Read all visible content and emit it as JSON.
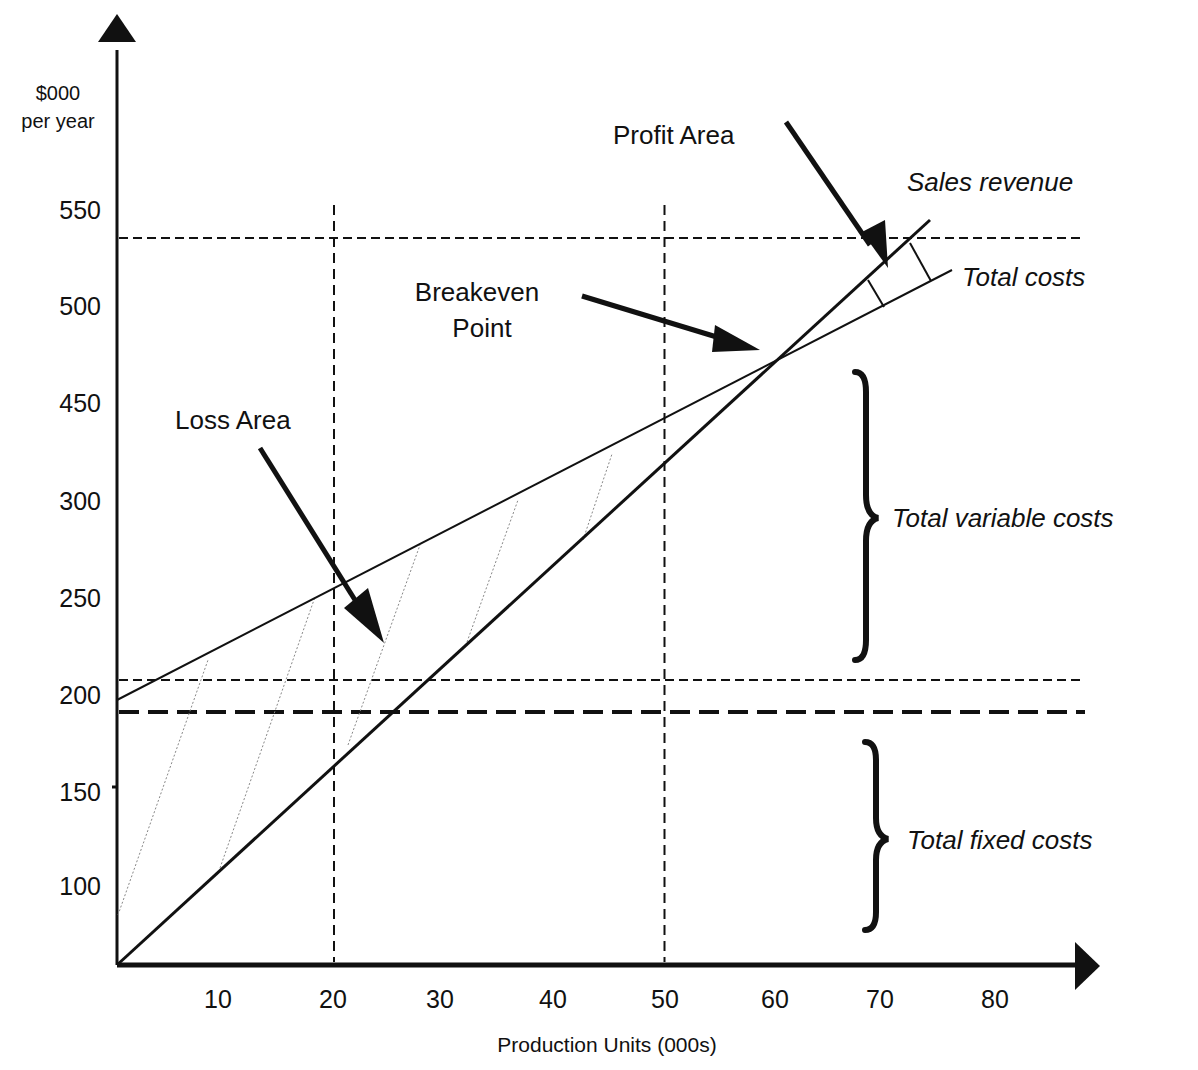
{
  "chart_data": {
    "type": "line",
    "title": "",
    "xlabel": "Production Units (000s)",
    "ylabel": [
      "$000",
      "per year"
    ],
    "x_ticks": [
      10,
      20,
      30,
      40,
      50,
      60,
      70,
      80
    ],
    "y_ticks": [
      550,
      500,
      450,
      300,
      250,
      200,
      150,
      100
    ],
    "xlim": [
      0,
      85
    ],
    "grid": false,
    "series": [
      {
        "name": "Sales revenue",
        "style": "solid-thick",
        "points": [
          [
            0,
            0
          ],
          [
            73,
            560
          ]
        ]
      },
      {
        "name": "Total costs",
        "style": "solid-thin",
        "points": [
          [
            0,
            195
          ],
          [
            75,
            520
          ]
        ]
      }
    ],
    "breakeven": {
      "x": 60,
      "label": "Breakeven Point"
    },
    "reference_lines": {
      "vertical_dashed_x": [
        20,
        50
      ],
      "horizontal_dashed_y": [
        537,
        207
      ],
      "horizontal_dashed_thick_y": 190
    },
    "annotations": [
      {
        "id": "profit-area",
        "text": "Profit Area"
      },
      {
        "id": "breakeven",
        "text": [
          "Breakeven",
          "Point"
        ]
      },
      {
        "id": "loss-area",
        "text": "Loss Area"
      },
      {
        "id": "sales-revenue",
        "text": "Sales revenue",
        "italic": true
      },
      {
        "id": "total-costs",
        "text": "Total costs",
        "italic": true
      },
      {
        "id": "total-variable-costs",
        "text": "Total variable costs",
        "italic": true
      },
      {
        "id": "total-fixed-costs",
        "text": "Total fixed costs",
        "italic": true
      }
    ]
  }
}
